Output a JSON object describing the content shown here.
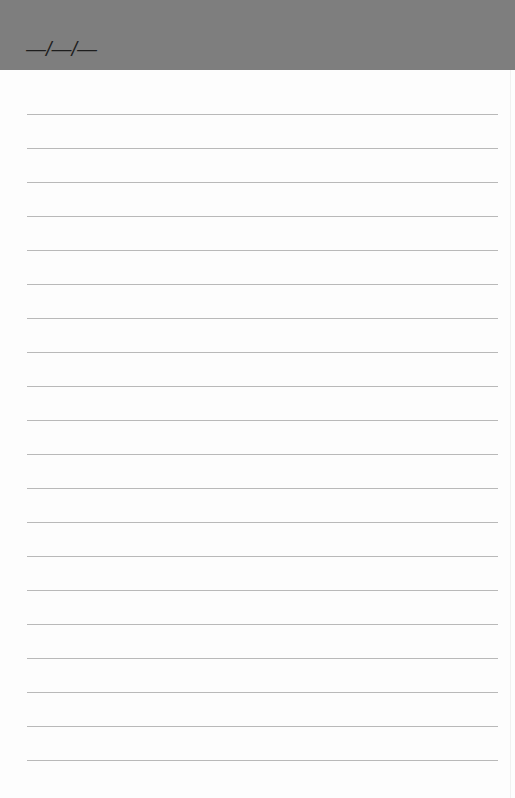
{
  "header": {
    "date_placeholder": "—/—/—",
    "background_color": "#7e7e7e"
  },
  "sheet": {
    "line_count": 20,
    "first_line_y": 114,
    "line_spacing": 34,
    "line_color": "#b9b9b9",
    "lines": [
      "",
      "",
      "",
      "",
      "",
      "",
      "",
      "",
      "",
      "",
      "",
      "",
      "",
      "",
      "",
      "",
      "",
      "",
      "",
      ""
    ]
  }
}
